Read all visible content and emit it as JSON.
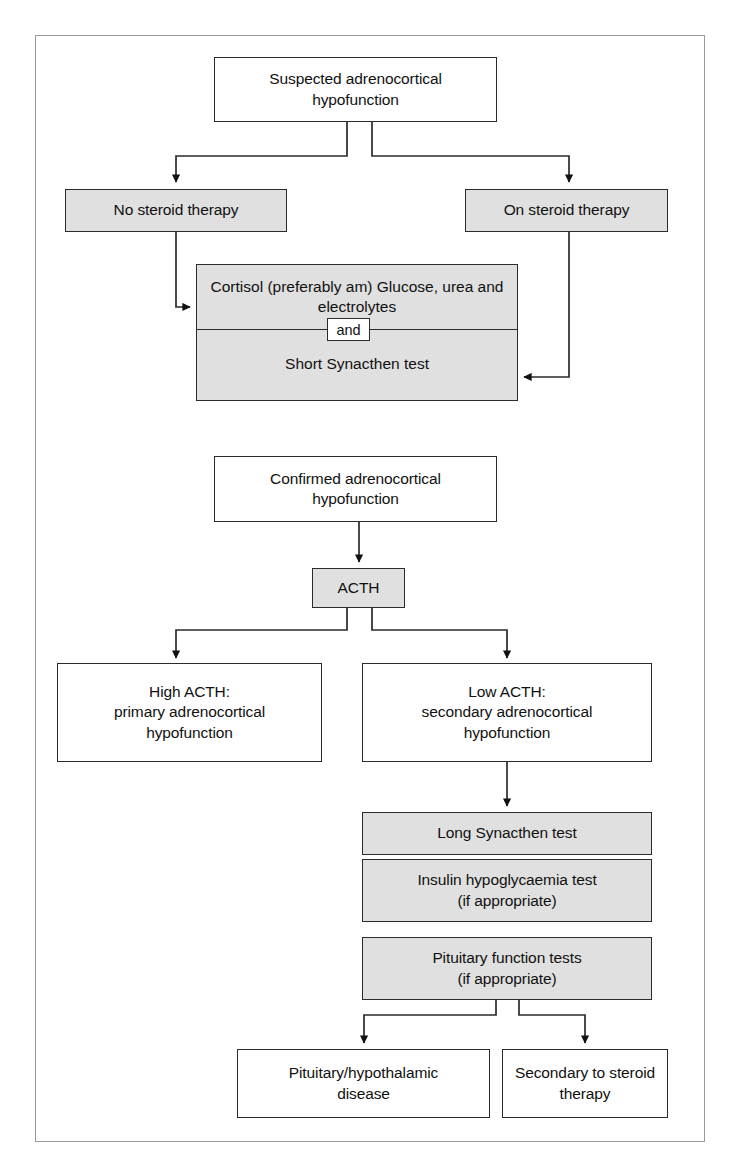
{
  "figure": {
    "type": "clinical-flowchart",
    "title_visible": false,
    "colors": {
      "process_fill": "#e0e0e0",
      "terminal_fill": "#ffffff",
      "stroke": "#2b2b2b",
      "frame": "#9a9a9a"
    }
  },
  "nodes": {
    "suspected": "Suspected adrenocortical\nhypofunction",
    "no_steroid": "No steroid therapy",
    "on_steroid": "On steroid therapy",
    "tests_first": "Cortisol (preferably am)\nGlucose, urea and electrolytes",
    "and_chip": "and",
    "tests_second": "Short Synacthen test",
    "confirmed": "Confirmed adrenocortical\nhypofunction",
    "acth": "ACTH",
    "high_acth": "High ACTH:\nprimary adrenocortical\nhypofunction",
    "low_acth": "Low ACTH:\nsecondary adrenocortical\nhypofunction",
    "long_synacthen": "Long Synacthen test",
    "insulin_test": "Insulin hypoglycaemia test\n(if appropriate)",
    "pituitary_tests": "Pituitary function tests\n(if appropriate)",
    "pituitary_disease": "Pituitary/hypothalamic\ndisease",
    "secondary_steroid": "Secondary to steroid\ntherapy"
  },
  "edges": [
    {
      "from": "suspected",
      "to": "no_steroid"
    },
    {
      "from": "suspected",
      "to": "on_steroid"
    },
    {
      "from": "no_steroid",
      "to": "tests_first"
    },
    {
      "from": "on_steroid",
      "to": "tests_second"
    },
    {
      "from": "confirmed",
      "to": "acth"
    },
    {
      "from": "acth",
      "to": "high_acth"
    },
    {
      "from": "acth",
      "to": "low_acth"
    },
    {
      "from": "low_acth",
      "to": "long_synacthen"
    },
    {
      "from": "pituitary_tests",
      "to": "pituitary_disease"
    },
    {
      "from": "pituitary_tests",
      "to": "secondary_steroid"
    }
  ]
}
